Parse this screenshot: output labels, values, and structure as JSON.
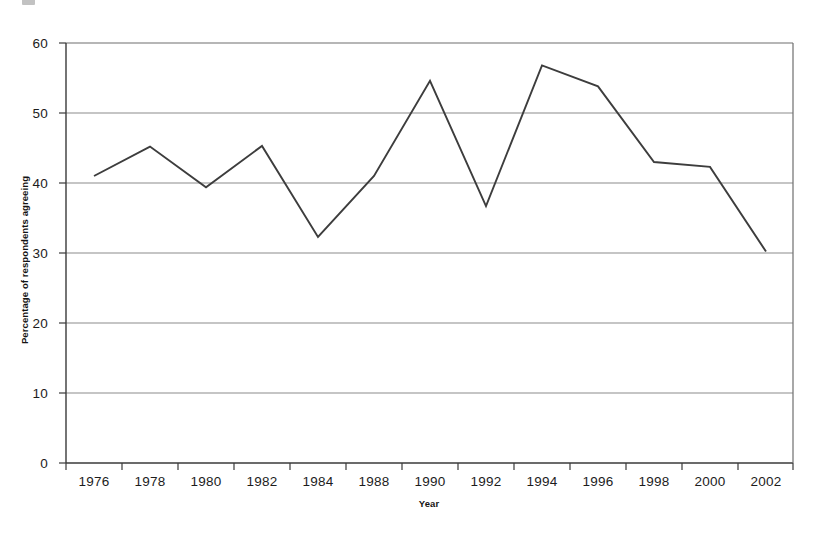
{
  "chart_data": {
    "type": "line",
    "title": "",
    "subtitle": "",
    "xlabel": "Year",
    "ylabel": "Percentage of respondents agreeing",
    "x": [
      1976,
      1978,
      1980,
      1982,
      1984,
      1988,
      1990,
      1992,
      1994,
      1996,
      1998,
      2000,
      2002
    ],
    "categories": [
      "1976",
      "1978",
      "1980",
      "1982",
      "1984",
      "1988",
      "1990",
      "1992",
      "1994",
      "1996",
      "1998",
      "2000",
      "2002"
    ],
    "values": [
      41.0,
      45.2,
      39.4,
      45.3,
      32.3,
      41.0,
      54.6,
      36.7,
      56.8,
      53.8,
      43.0,
      42.3,
      30.2
    ],
    "series": [
      {
        "name": "Percentage of respondents agreeing",
        "values": [
          41.0,
          45.2,
          39.4,
          45.3,
          32.3,
          41.0,
          54.6,
          36.7,
          56.8,
          53.8,
          43.0,
          42.3,
          30.2
        ],
        "color": "#3d3d3d"
      }
    ],
    "ylim": [
      0,
      60
    ],
    "yticks": [
      0,
      10,
      20,
      30,
      40,
      50,
      60
    ],
    "ytick_labels": [
      "0",
      "10",
      "20",
      "30",
      "40",
      "50",
      "60"
    ],
    "xtick_labels": [
      "1976",
      "1978",
      "1980",
      "1982",
      "1984",
      "1988",
      "1990",
      "1992",
      "1994",
      "1996",
      "1998",
      "2000",
      "2002"
    ],
    "grid": "horizontal",
    "legend": "none",
    "annotations": [],
    "line_color": "#3d3d3d",
    "grid_color": "#8c8c8c",
    "axis_color": "#3a3a3a",
    "background": "#ffffff"
  }
}
